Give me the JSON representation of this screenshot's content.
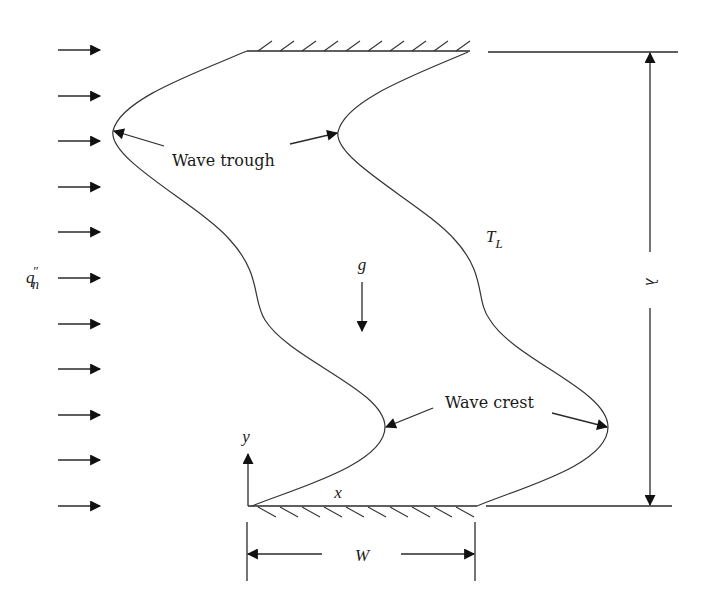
{
  "figure": {
    "heat_flux_label_base": "q",
    "heat_flux_label_sup": "″",
    "heat_flux_label_sub": "n",
    "heat_flux_arrow_count": 11,
    "gravity_label": "g",
    "liquid_temp_label_base": "T",
    "liquid_temp_label_sub": "L",
    "wavelength_label": "λ",
    "width_label": "W",
    "x_axis_label": "x",
    "y_axis_label": "y",
    "annotations": {
      "wave_trough": "Wave trough",
      "wave_crest": "Wave crest"
    }
  },
  "colors": {
    "stroke": "#2a2a2a",
    "background": "#ffffff"
  }
}
